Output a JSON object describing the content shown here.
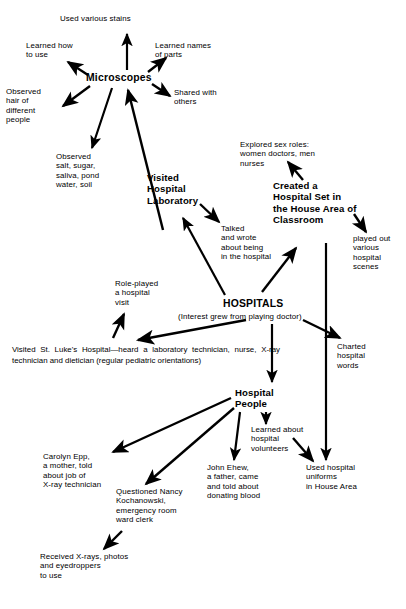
{
  "diagram": {
    "title_node": "Microscopes",
    "canvas": {
      "width": 406,
      "height": 609,
      "background": "#ffffff",
      "ink": "#000000"
    },
    "nodes": {
      "used_various_stains": "Used various stains",
      "learned_how_to_use": "Learned how\nto use",
      "learned_names_of_parts": "Learned names\nof parts",
      "microscopes": "Microscopes",
      "shared_with_others": "Shared with\nothers",
      "observed_hair": "Observed\nhair of\ndifferent\npeople",
      "observed_salt": "Observed\nsalt, sugar,\nsaliva, pond\nwater, soil",
      "visited_hospital_laboratory": "Visited\nHospital\nLaboratory",
      "explored_sex_roles": "Explored sex roles:\nwomen doctors, men\nnurses",
      "created_hospital_set": "Created a\nHospital Set in\nthe House Area of\nClassroom",
      "talked_and_wrote": "Talked\nand wrote\nabout being\nin the hospital",
      "played_out_scenes": "played out\nvarious\nhospital\nscenes",
      "role_played_visit": "Role-played\na hospital\nvisit",
      "hospitals": "HOSPITALS",
      "hospitals_subtitle": "(Interest grew from playing doctor)",
      "visited_st_lukes": "Visited St. Luke's Hospital—heard a laboratory technician, nurse, X-ray technician and dietician (regular pediatric orientations)",
      "charted_hospital_words": "Charted\nhospital\nwords",
      "hospital_people": "Hospital\nPeople",
      "learned_about_volunteers": "Learned about\nhospital\nvolunteers",
      "carolyn_epp": "Carolyn Epp,\na mother, told\nabout job of\nX-ray technician",
      "questioned_nancy": "Questioned Nancy\nKochanowski,\nemergency room\nward clerk",
      "john_ehew": "John Ehew,\na father, came\nand told about\ndonating blood",
      "used_hospital_uniforms": "Used hospital\nuniforms\nin House Area",
      "received_xrays": "Received X-rays, photos\nand eyedroppers\nto use"
    },
    "edges": [
      {
        "from": "microscopes",
        "to": "used_various_stains",
        "name": "edge-microscopes-to-stains"
      },
      {
        "from": "microscopes",
        "to": "learned_how_to_use",
        "name": "edge-microscopes-to-learned-how"
      },
      {
        "from": "microscopes",
        "to": "learned_names_of_parts",
        "name": "edge-microscopes-to-names-of-parts"
      },
      {
        "from": "microscopes",
        "to": "shared_with_others",
        "name": "edge-microscopes-to-shared-with-others"
      },
      {
        "from": "microscopes",
        "to": "observed_hair",
        "name": "edge-microscopes-to-observed-hair"
      },
      {
        "from": "microscopes",
        "to": "observed_salt",
        "name": "edge-microscopes-to-observed-salt"
      },
      {
        "from": "hospitals",
        "to": "microscopes",
        "name": "edge-hospitals-to-microscopes"
      },
      {
        "from": "hospitals",
        "to": "visited_hospital_laboratory",
        "name": "edge-hospitals-to-laboratory"
      },
      {
        "from": "visited_hospital_laboratory",
        "to": "talked_and_wrote",
        "name": "edge-laboratory-to-talked-wrote"
      },
      {
        "from": "created_hospital_set",
        "to": "explored_sex_roles",
        "name": "edge-hospital-set-to-sex-roles"
      },
      {
        "from": "created_hospital_set",
        "to": "played_out_scenes",
        "name": "edge-hospital-set-to-played-out"
      },
      {
        "from": "hospitals",
        "to": "created_hospital_set",
        "name": "edge-hospitals-to-hospital-set"
      },
      {
        "from": "created_hospital_set",
        "to": "used_hospital_uniforms",
        "name": "edge-hospital-set-to-uniforms"
      },
      {
        "from": "hospitals",
        "to": "visited_st_lukes",
        "name": "edge-hospitals-to-st-lukes"
      },
      {
        "from": "visited_st_lukes",
        "to": "role_played_visit",
        "name": "edge-st-lukes-to-role-played"
      },
      {
        "from": "hospitals",
        "to": "charted_hospital_words",
        "name": "edge-hospitals-to-charted-words"
      },
      {
        "from": "hospitals",
        "to": "hospital_people",
        "name": "edge-hospitals-to-hospital-people"
      },
      {
        "from": "hospital_people",
        "to": "carolyn_epp",
        "name": "edge-people-to-carolyn-epp"
      },
      {
        "from": "hospital_people",
        "to": "questioned_nancy",
        "name": "edge-people-to-questioned-nancy"
      },
      {
        "from": "hospital_people",
        "to": "john_ehew",
        "name": "edge-people-to-john-ehew"
      },
      {
        "from": "hospital_people",
        "to": "learned_about_volunteers",
        "name": "edge-people-to-volunteers"
      },
      {
        "from": "learned_about_volunteers",
        "to": "used_hospital_uniforms",
        "name": "edge-volunteers-to-uniforms"
      },
      {
        "from": "questioned_nancy",
        "to": "received_xrays",
        "name": "edge-nancy-to-received-xrays"
      }
    ]
  }
}
